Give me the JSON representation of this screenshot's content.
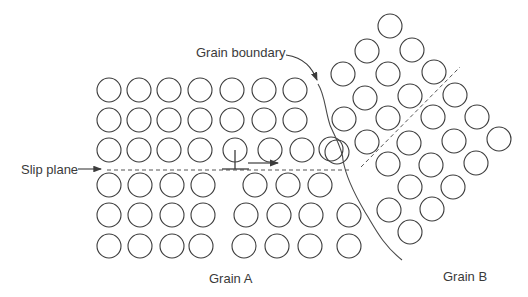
{
  "labels": {
    "grain_boundary": "Grain boundary",
    "slip_plane": "Slip plane",
    "grain_a": "Grain A",
    "grain_b": "Grain B"
  },
  "colors": {
    "stroke": "#3c3c3c",
    "text": "#3a3a3a",
    "background": "#ffffff"
  },
  "atom_radius": 12,
  "grain_a_atoms": [
    [
      109,
      90
    ],
    [
      139,
      90
    ],
    [
      169,
      90
    ],
    [
      200,
      90
    ],
    [
      232,
      90
    ],
    [
      264,
      90
    ],
    [
      295,
      90
    ],
    [
      109,
      120
    ],
    [
      139,
      120
    ],
    [
      169,
      120
    ],
    [
      200,
      120
    ],
    [
      232,
      120
    ],
    [
      264,
      120
    ],
    [
      295,
      120
    ],
    [
      109,
      150
    ],
    [
      139,
      150
    ],
    [
      169,
      150
    ],
    [
      200,
      150
    ],
    [
      235,
      150
    ],
    [
      270,
      150
    ],
    [
      302,
      150
    ],
    [
      337,
      152
    ],
    [
      109,
      185
    ],
    [
      140,
      185
    ],
    [
      172,
      185
    ],
    [
      203,
      185
    ],
    [
      255,
      185
    ],
    [
      288,
      185
    ],
    [
      320,
      185
    ],
    [
      109,
      215
    ],
    [
      140,
      215
    ],
    [
      172,
      215
    ],
    [
      203,
      215
    ],
    [
      246,
      215
    ],
    [
      279,
      215
    ],
    [
      311,
      215
    ],
    [
      349,
      215
    ],
    [
      109,
      246
    ],
    [
      140,
      246
    ],
    [
      172,
      246
    ],
    [
      201,
      246
    ],
    [
      244,
      246
    ],
    [
      277,
      246
    ],
    [
      310,
      246
    ],
    [
      349,
      246
    ]
  ],
  "grain_b_atoms": [
    [
      390,
      26
    ],
    [
      367,
      51
    ],
    [
      412,
      50
    ],
    [
      343,
      74
    ],
    [
      388,
      74
    ],
    [
      434,
      72
    ],
    [
      365,
      98
    ],
    [
      410,
      96
    ],
    [
      455,
      95
    ],
    [
      344,
      119
    ],
    [
      388,
      118
    ],
    [
      433,
      117
    ],
    [
      477,
      117
    ],
    [
      331,
      149
    ],
    [
      367,
      142
    ],
    [
      409,
      143
    ],
    [
      454,
      141
    ],
    [
      499,
      139
    ],
    [
      388,
      164
    ],
    [
      431,
      165
    ],
    [
      476,
      163
    ],
    [
      410,
      187
    ],
    [
      453,
      187
    ],
    [
      389,
      210
    ],
    [
      432,
      209
    ],
    [
      410,
      232
    ]
  ]
}
